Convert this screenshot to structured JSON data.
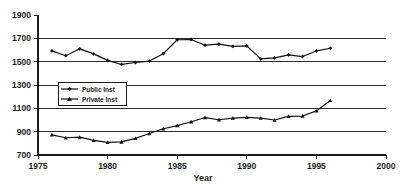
{
  "chart_data": {
    "type": "line",
    "title": "",
    "xlabel": "Year",
    "ylabel": "",
    "xlim": [
      1975,
      2000
    ],
    "ylim": [
      700,
      1900
    ],
    "grid": true,
    "legend_position": "inside-left",
    "xticks": [
      "1975",
      "1980",
      "1985",
      "1990",
      "1995",
      "2000"
    ],
    "xtick_values": [
      1975,
      1980,
      1985,
      1990,
      1995,
      2000
    ],
    "yticks": [
      "700",
      "900",
      "1100",
      "1300",
      "1500",
      "1700",
      "1900"
    ],
    "ytick_values": [
      700,
      900,
      1100,
      1300,
      1500,
      1700,
      1900
    ],
    "x": [
      1976,
      1977,
      1978,
      1979,
      1980,
      1981,
      1982,
      1983,
      1984,
      1985,
      1986,
      1987,
      1988,
      1989,
      1990,
      1991,
      1992,
      1993,
      1994,
      1995,
      1996
    ],
    "series": [
      {
        "name": "Public Inst",
        "marker": "diamond",
        "values": [
          1592,
          1551,
          1610,
          1567,
          1511,
          1476,
          1493,
          1505,
          1568,
          1688,
          1690,
          1641,
          1650,
          1631,
          1635,
          1524,
          1532,
          1558,
          1544,
          1592,
          1615
        ]
      },
      {
        "name": "Private Inst",
        "marker": "triangle",
        "values": [
          873,
          848,
          853,
          826,
          808,
          812,
          843,
          884,
          925,
          952,
          985,
          1021,
          1002,
          1016,
          1023,
          1016,
          1000,
          1031,
          1034,
          1078,
          1168
        ]
      }
    ]
  },
  "axis": {
    "x_title": "Year"
  },
  "legend": {
    "entries": [
      {
        "label": "Public Inst"
      },
      {
        "label": "Private Inst"
      }
    ]
  }
}
